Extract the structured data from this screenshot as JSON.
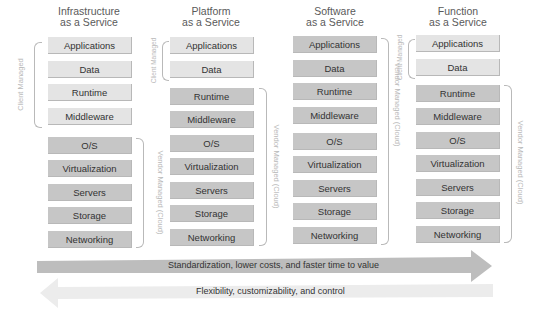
{
  "diagram": {
    "columns": [
      {
        "title_line1": "Infrastructure",
        "title_line2": "as a Service",
        "layers": [
          "Applications",
          "Data",
          "Runtime",
          "Middleware",
          "O/S",
          "Virtualization",
          "Servers",
          "Storage",
          "Networking"
        ],
        "client_managed_count": 4,
        "client_label": "Client Managed",
        "vendor_label": "Vendor Managed (Cloud)"
      },
      {
        "title_line1": "Platform",
        "title_line2": "as a Service",
        "layers": [
          "Applications",
          "Data",
          "Runtime",
          "Middleware",
          "O/S",
          "Virtualization",
          "Servers",
          "Storage",
          "Networking"
        ],
        "client_managed_count": 2,
        "client_label": "Client Managed",
        "vendor_label": "Vendor Managed (Cloud)"
      },
      {
        "title_line1": "Software",
        "title_line2": "as a Service",
        "layers": [
          "Applications",
          "Data",
          "Runtime",
          "Middleware",
          "O/S",
          "Virtualization",
          "Servers",
          "Storage",
          "Networking"
        ],
        "client_managed_count": 0,
        "vendor_label": "Vendor Managed (Cloud)"
      },
      {
        "title_line1": "Function",
        "title_line2": "as a Service",
        "layers": [
          "Applications",
          "Data",
          "Runtime",
          "Middleware",
          "O/S",
          "Virtualization",
          "Servers",
          "Storage",
          "Networking"
        ],
        "client_managed_count": 2,
        "client_label": "Client Managed",
        "vendor_label": "Vendor Managed (Cloud)"
      }
    ],
    "arrows": {
      "right": "Standardization, lower costs, and faster time to value",
      "left": "Flexibility, customizability, and control"
    },
    "colors": {
      "client_box": "#e4e4e4",
      "vendor_box": "#c6c6c6",
      "right_arrow": "#bdbdbd",
      "left_arrow": "#ececec",
      "bracket": "#b9b9b9"
    }
  }
}
